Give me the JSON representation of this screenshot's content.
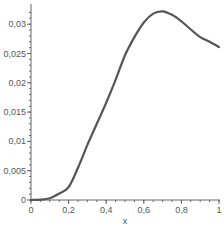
{
  "chart_data": {
    "type": "line",
    "title": "",
    "xlabel": "x",
    "ylabel": "",
    "xlim": [
      0,
      1
    ],
    "ylim": [
      0,
      0.033
    ],
    "grid": false,
    "legend": null,
    "x_ticks": [
      0,
      0.2,
      0.4,
      0.6,
      0.8,
      1
    ],
    "x_tick_labels": [
      "0",
      "0,2",
      "0,4",
      "0,6",
      "0,8",
      "1"
    ],
    "y_ticks": [
      0,
      0.005,
      0.01,
      0.015,
      0.02,
      0.025,
      0.03
    ],
    "y_tick_labels": [
      "0",
      "0,005",
      "0,01",
      "0,015",
      "0,02",
      "0,025",
      "0,03"
    ],
    "series": [
      {
        "name": "f(x)",
        "color": "#555555",
        "x": [
          0,
          0.05,
          0.1,
          0.15,
          0.2,
          0.25,
          0.3,
          0.35,
          0.4,
          0.45,
          0.5,
          0.55,
          0.6,
          0.65,
          0.7,
          0.75,
          0.8,
          0.85,
          0.9,
          0.95,
          1.0
        ],
        "y": [
          0,
          5e-05,
          0.0003,
          0.0011,
          0.0022,
          0.0055,
          0.0094,
          0.013,
          0.0166,
          0.0205,
          0.0247,
          0.0278,
          0.0303,
          0.0318,
          0.0322,
          0.0316,
          0.0305,
          0.0291,
          0.0278,
          0.027,
          0.0261
        ]
      }
    ]
  }
}
